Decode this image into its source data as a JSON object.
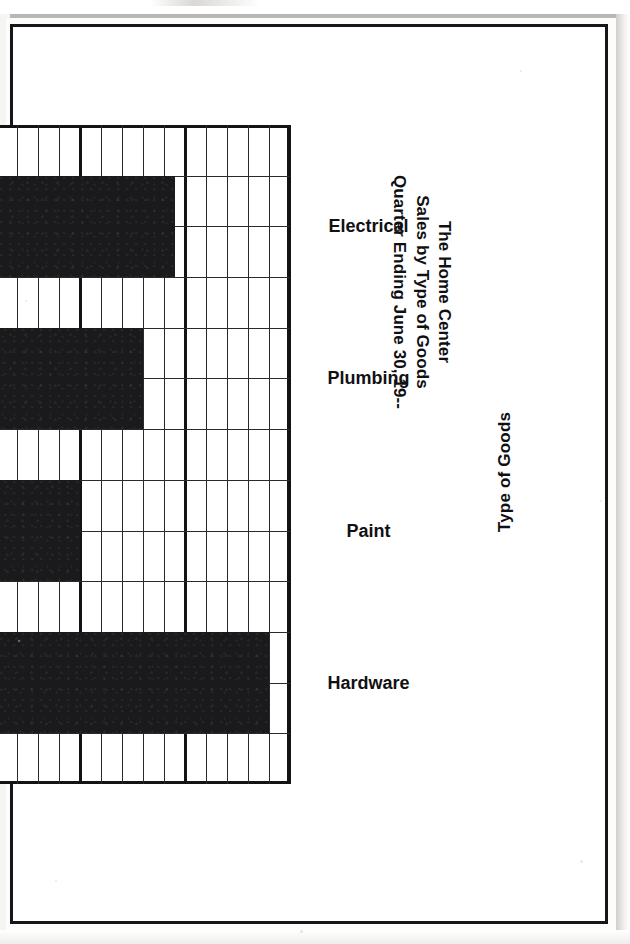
{
  "document": {
    "media": "scanned-page",
    "orientation_note": "figure printed rotated 90 degrees on the page"
  },
  "chart_data": {
    "type": "bar",
    "title": "The Home Center\nSales by Type of Goods\nQuarter Ending June 30, 19--",
    "title_lines": [
      "The Home Center",
      "Sales by Type of Goods",
      "Quarter Ending June 30, 19--"
    ],
    "orientation": "horizontal-bars-rotated",
    "categories": [
      "Electrical",
      "Plumbing",
      "Paint",
      "Hardware"
    ],
    "values": [
      29,
      26,
      20,
      38
    ],
    "xlabel": "Type of Goods",
    "ylabel": "Thousands of Dollars",
    "ylim": [
      0,
      40
    ],
    "ticks": [
      "0",
      "10",
      "20",
      "30",
      "40"
    ],
    "tick_values": [
      0,
      10,
      20,
      30,
      40
    ],
    "minor_step": 2,
    "major_step": 10,
    "grid": true,
    "legend": null,
    "bar_color": "#1a1a1c",
    "grid_color": "#2a2a2e",
    "frame_color": "#131316",
    "paper_color": "#ffffff"
  },
  "axis": {
    "value_label": "Thousands of Dollars",
    "category_label": "Type of Goods",
    "tick_0": "0",
    "tick_10": "10",
    "tick_20": "20",
    "tick_30": "30",
    "tick_40": "40"
  },
  "bars": {
    "electrical": {
      "label": "Electrical",
      "value": 29
    },
    "plumbing": {
      "label": "Plumbing",
      "value": 26
    },
    "paint": {
      "label": "Paint",
      "value": 20
    },
    "hardware": {
      "label": "Hardware",
      "value": 38
    }
  },
  "title": {
    "line1": "The Home Center",
    "line2": "Sales by Type of Goods",
    "line3": "Quarter Ending June 30, 19--"
  }
}
